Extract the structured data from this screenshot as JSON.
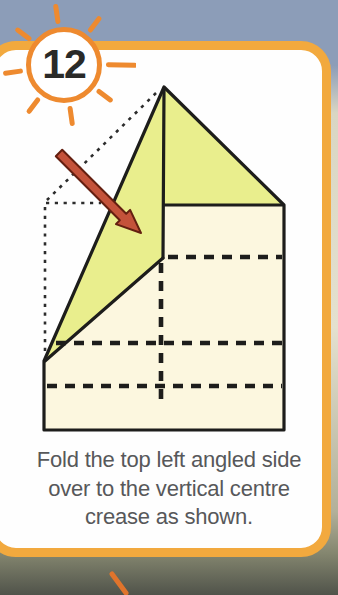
{
  "step": {
    "number": "12"
  },
  "caption": {
    "line1": "Fold the top left angled side",
    "line2": "over to the vertical centre",
    "line3": "crease as shown."
  },
  "colors": {
    "bg-top": "#8c9db8",
    "bg-upper-mid": "#d9d6c3",
    "bg-mid": "#e4e1cf",
    "bg-lower": "#b2b099",
    "bg-bottom": "#50534a",
    "card-border": "#f2a93e",
    "card-bg": "#fefefe",
    "badge-ring": "#ee8a2f",
    "badge-bg": "#ffffff",
    "step-number": "#2a2a28",
    "paper-fill": "#fcf7df",
    "flap-fill": "#e9ee8d",
    "outline": "#1d1d1b",
    "arrow-fill": "#c4523a",
    "arrow-outline": "#641f10",
    "caption-text": "#57585a",
    "next-ray": "#e0742c"
  }
}
